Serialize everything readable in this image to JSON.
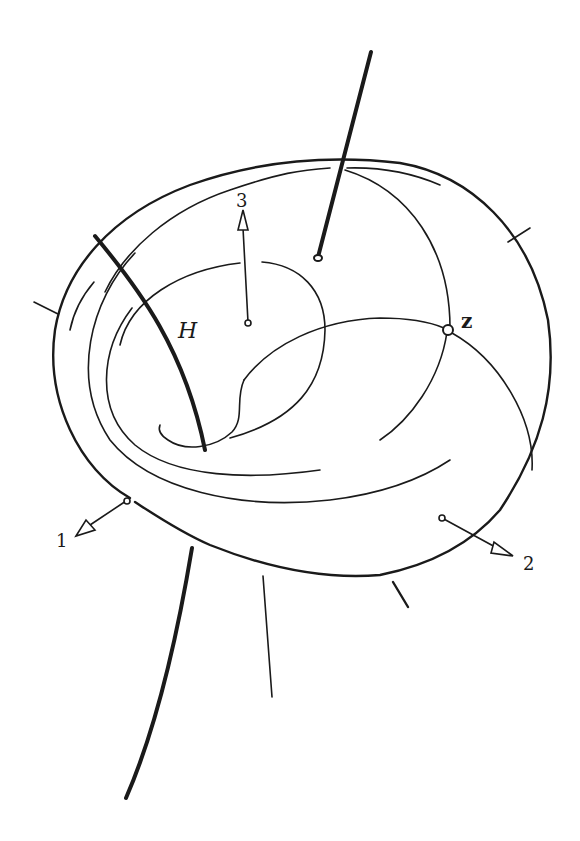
{
  "figure": {
    "labels": {
      "curve_h": "H",
      "point_z": "z",
      "axis_1": "1",
      "axis_2": "2",
      "axis_3": "3"
    },
    "colors": {
      "ink": "#1a1a1a",
      "background": "#ffffff"
    }
  }
}
